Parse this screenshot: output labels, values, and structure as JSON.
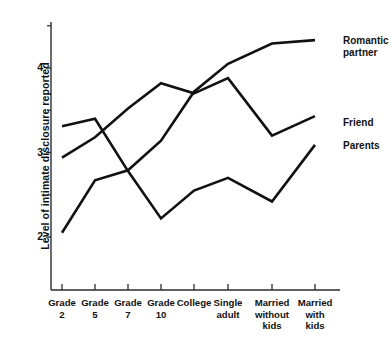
{
  "chart_data": {
    "type": "line",
    "title": "",
    "xlabel": "",
    "ylabel": "Level of intimate disclosure reported",
    "categories": [
      "Grade\n2",
      "Grade\n5",
      "Grade\n7",
      "Grade\n10",
      "College",
      "Single\nadult",
      "Married\nwithout\nkids",
      "Married\nwith\nkids"
    ],
    "yticks": [
      2,
      3,
      4
    ],
    "ytick_labels": [
      "2",
      "3",
      "4"
    ],
    "yminor_ticks": [
      2.5,
      3.5,
      4.5
    ],
    "ylim": [
      1.6,
      4.55
    ],
    "grid": false,
    "legend_position": "right-inline",
    "series": [
      {
        "name": "Romantic\npartner",
        "label": "Romantic partner",
        "color": "#111111",
        "values": [
          2.05,
          2.67,
          2.79,
          3.14,
          3.72,
          4.05,
          4.29,
          4.33
        ]
      },
      {
        "name": "Friend",
        "label": "Friend",
        "color": "#111111",
        "values": [
          2.94,
          3.18,
          3.52,
          3.82,
          3.7,
          3.88,
          3.2,
          3.43
        ]
      },
      {
        "name": "Parents",
        "label": "Parents",
        "color": "#111111",
        "values": [
          3.31,
          3.4,
          2.78,
          2.22,
          2.55,
          2.7,
          2.42,
          3.09
        ]
      }
    ]
  },
  "axis": {
    "ylabel": "Level of intimate disclosure reported"
  },
  "labels": {
    "romantic_partner": "Romantic\npartner",
    "friend": "Friend",
    "parents": "Parents"
  }
}
